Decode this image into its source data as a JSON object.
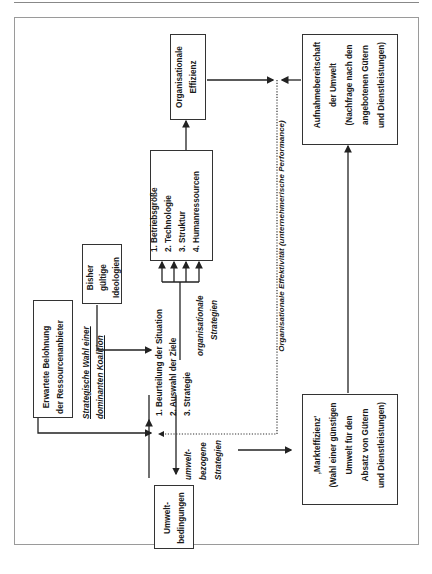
{
  "diagram": {
    "boxes": {
      "erwartete_belohnung": [
        "Erwartete Belohnung",
        "der Ressourcenanbieter"
      ],
      "bisher_gueltige": [
        "Bisher",
        "gültige",
        "Ideologien"
      ],
      "strategie_list": [
        "1. Beurteilung der Situation",
        "2. Auswahl der Ziele",
        "3. Strategie"
      ],
      "org_factors": [
        "1. Betriebsgröße",
        "2. Technologie",
        "3. Struktur",
        "4. Humanressourcen"
      ],
      "org_effizienz": [
        "Organisationale",
        "Effizienz"
      ],
      "aufnahmebereitschaft": [
        "Aufnahmebereitschaft",
        "der Umwelt",
        "(Nachfrage nach den",
        "angebotenen Gütern",
        "und Dienstleistungen)"
      ],
      "markteffizienz": [
        "‚Markteffizienz'",
        "(Wahl einer günstigen",
        "Umwelt für den",
        "Absatz von Gütern",
        "und Dienstleistungen)"
      ],
      "umweltbedingungen": [
        "Umwelt-",
        "bedingungen"
      ]
    },
    "labels": {
      "strategische_wahl_1": "Strategische Wahl einer",
      "strategische_wahl_2": "dominanten Koalition",
      "org_strategien_1": "organisationale",
      "org_strategien_2": "Strategien",
      "umwelt_strategien": [
        "umwelt-",
        "bezogene",
        "Strategien"
      ],
      "effektivitaet": "Organisationale Effektivität (unternehmerische Performance)"
    }
  }
}
